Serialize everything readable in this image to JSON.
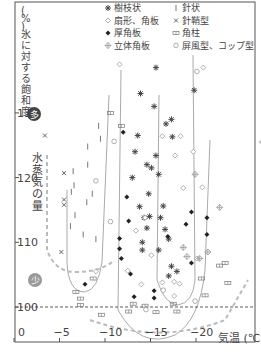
{
  "chart_data": {
    "type": "scatter",
    "title": "",
    "ylabel": "氷に対する飽和度 (%)",
    "xlabel": "気温 (℃)",
    "ylim": [
      95,
      142
    ],
    "xlim": [
      0,
      -27
    ],
    "yticks": [
      100,
      110,
      120,
      130
    ],
    "xticks": [
      0,
      -5,
      -10,
      -15,
      -20
    ],
    "xtick_labels": [
      "0",
      "−5",
      "−10",
      "−15",
      "−20"
    ],
    "ytick_labels": [
      "100",
      "110",
      "120",
      "130"
    ],
    "grid": false,
    "annotations": {
      "vapor_axis_label": "水蒸気の量",
      "many_badge": "多",
      "few_badge": "少",
      "water_saturation_line": 100
    },
    "legend": [
      {
        "symbol": "asterisk",
        "label": "樹枝状"
      },
      {
        "symbol": "open-diamond",
        "label": "扇形、角板"
      },
      {
        "symbol": "filled-diamond",
        "label": "厚角板"
      },
      {
        "symbol": "cross-plus",
        "label": "立体角板"
      },
      {
        "symbol": "bar",
        "label": "針状"
      },
      {
        "symbol": "x",
        "label": "針鞘型"
      },
      {
        "symbol": "double-bar",
        "label": "角柱"
      },
      {
        "symbol": "circle",
        "label": "屏風型、コップ型"
      }
    ],
    "series": [
      {
        "name": "樹枝状",
        "symbol": "asterisk",
        "points": [
          [
            -15.6,
            137
          ],
          [
            -19.8,
            133.5
          ],
          [
            -13.6,
            126.5
          ],
          [
            -17.4,
            126.3
          ],
          [
            -15.1,
            121.5
          ],
          [
            -13.0,
            120.0
          ],
          [
            -15.9,
            120.5
          ],
          [
            -14.8,
            117.5
          ],
          [
            -13.8,
            115.5
          ],
          [
            -16.4,
            115.6
          ],
          [
            -14.3,
            113.8
          ],
          [
            -16.1,
            113.8
          ],
          [
            -14.6,
            112.2
          ],
          [
            -14.6,
            122
          ],
          [
            -17.3,
            129
          ],
          [
            -13.9,
            133
          ],
          [
            -15.4,
            131
          ],
          [
            -16.7,
            128.3
          ],
          [
            -15.6,
            123.4
          ],
          [
            -13.3,
            124
          ],
          [
            -14.9,
            114
          ],
          [
            -17.0,
            110.5
          ],
          [
            -14.1,
            110
          ],
          [
            -16.6,
            112
          ],
          [
            -17.9,
            105.5
          ],
          [
            -14.1,
            108.8
          ],
          [
            -15.9,
            108.8
          ],
          [
            -17.3,
            106.3
          ],
          [
            -17.0,
            104.8
          ]
        ]
      },
      {
        "name": "扇形、角板",
        "symbol": "open-diamond",
        "points": [
          [
            -20.8,
            137
          ],
          [
            -11.6,
            137.5
          ],
          [
            -16.3,
            126.4
          ],
          [
            -18.3,
            126.4
          ],
          [
            -19.7,
            124
          ],
          [
            -20.7,
            118.5
          ],
          [
            -18.6,
            118.4
          ],
          [
            -17.7,
            123.4
          ],
          [
            -14.4,
            113.8
          ],
          [
            -13.4,
            111.8
          ],
          [
            -15.1,
            108
          ],
          [
            -20.1,
            107.5
          ],
          [
            -16.3,
            103.8
          ],
          [
            -17.6,
            103.9
          ],
          [
            -18.2,
            103.6
          ],
          [
            -14.0,
            103.5
          ],
          [
            -17.6,
            101.7
          ],
          [
            -12.5,
            105.6
          ],
          [
            -9.0,
            105.5
          ]
        ]
      },
      {
        "name": "厚角板",
        "symbol": "filled-diamond",
        "points": [
          [
            -12.0,
            127
          ],
          [
            -12.4,
            117
          ],
          [
            -12.6,
            113.3
          ],
          [
            -11.6,
            110.6
          ],
          [
            -11.6,
            109.0
          ],
          [
            -11.8,
            107.5
          ],
          [
            -12.8,
            105.1
          ],
          [
            -19.5,
            106.8
          ],
          [
            -15.4,
            102.5
          ],
          [
            -15.4,
            101.4
          ],
          [
            -13.2,
            101.6
          ],
          [
            -16.9,
            110.9
          ],
          [
            -18.9,
            112.8
          ],
          [
            -21.2,
            113.8
          ],
          [
            -21.2,
            111.2
          ],
          [
            -19.5,
            114.7
          ],
          [
            -7.8,
            103.5
          ]
        ]
      },
      {
        "name": "立体角板",
        "symbol": "cross-plus",
        "points": [
          [
            -19.9,
            120.5
          ],
          [
            -22.6,
            115.4
          ],
          [
            -27.3,
            125.5
          ],
          [
            -21.3,
            108.5
          ],
          [
            -19.0,
            107.8
          ],
          [
            -20.4,
            107.5
          ],
          [
            -18.6,
            109.2
          ]
        ]
      },
      {
        "name": "針状",
        "symbol": "bar",
        "points": [
          [
            -9.3,
            128
          ],
          [
            -9.5,
            126
          ],
          [
            -8.1,
            124.8
          ],
          [
            -8.1,
            122
          ],
          [
            -6.5,
            121
          ],
          [
            -6.6,
            118.8
          ],
          [
            -6.3,
            117.8
          ],
          [
            -8.0,
            116.2
          ],
          [
            -6.7,
            114.2
          ],
          [
            -8.6,
            117.5
          ],
          [
            -7.6,
            111.2
          ],
          [
            -6.2,
            112.5
          ],
          [
            -9.0,
            110.5
          ]
        ]
      },
      {
        "name": "針鞘型",
        "symbol": "x",
        "points": [
          [
            -3.4,
            126.5
          ],
          [
            -5.5,
            120.7
          ],
          [
            -5.5,
            116.6
          ],
          [
            -5.5,
            115.8
          ],
          [
            -5.2,
            108.5
          ]
        ]
      },
      {
        "name": "角柱",
        "symbol": "double-bar",
        "points": [
          [
            -10.6,
            130
          ],
          [
            -11.8,
            128
          ],
          [
            -8.7,
            104.4
          ],
          [
            -6.8,
            102.3
          ],
          [
            -7.3,
            101.3
          ],
          [
            -7.3,
            100.3
          ],
          [
            -9.6,
            98.8
          ],
          [
            -12.6,
            99.3
          ],
          [
            -15.6,
            99.2
          ],
          [
            -17.9,
            99.3
          ],
          [
            -21.0,
            101.8
          ],
          [
            -23.5,
            103.7
          ],
          [
            -23.2,
            106.8
          ],
          [
            -22.6,
            106.4
          ],
          [
            -20.6,
            104.4
          ],
          [
            -17.5,
            100.5
          ],
          [
            -14.4,
            100.2
          ],
          [
            -13.1,
            100.5
          ]
        ]
      },
      {
        "name": "屏風型、コップ型",
        "symbol": "circle",
        "points": [
          [
            -20.1,
            136.4
          ],
          [
            -11.0,
            125.6
          ],
          [
            -9.0,
            119.5
          ],
          [
            -10.6,
            113.2
          ],
          [
            -16.4,
            102.6
          ],
          [
            -19.9,
            100.9
          ],
          [
            -14.5,
            99.6
          ]
        ]
      }
    ],
    "curves_note": "Gray solid U-shaped envelopes and dashed gray envelope outline growth regions per crystal habit."
  }
}
